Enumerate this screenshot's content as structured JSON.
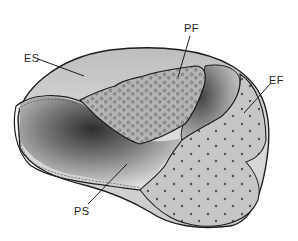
{
  "figure": {
    "labels": {
      "es": "ES",
      "pf": "PF",
      "ef": "EF",
      "ps": "PS"
    },
    "colors": {
      "background": "#ffffff",
      "surface_light": "#d9d9d9",
      "surface_mid": "#b8b8b8",
      "surface_dark": "#3a3a3a",
      "fracture_face": "#c4c4c4",
      "outline": "#1e1e1e",
      "label": "#222222"
    }
  }
}
